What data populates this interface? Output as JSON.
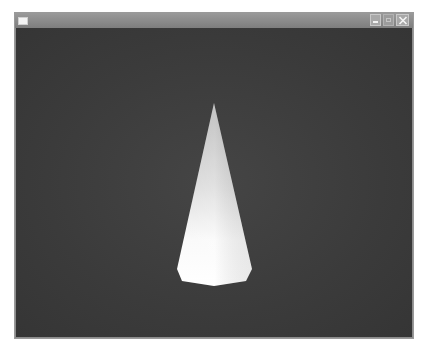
{
  "window": {
    "title": "",
    "buttons": {
      "minimize": "minimize",
      "maximize": "maximize",
      "close": "close"
    }
  },
  "scene": {
    "background_color": "#3c3c3c",
    "object": "cone",
    "object_color": "#f2f2f2"
  }
}
